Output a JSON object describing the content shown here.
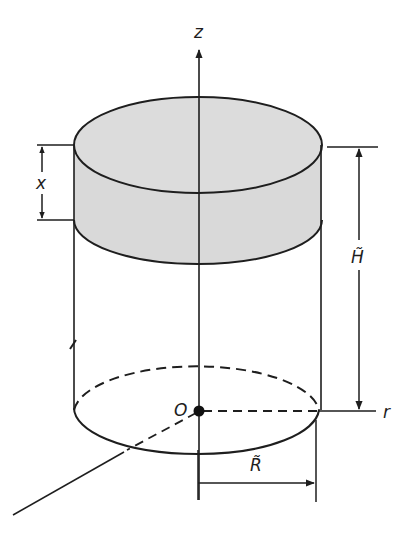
{
  "figure": {
    "colors": {
      "line": "#1e1e1e",
      "fill_shaded": "#d9d9d9",
      "background": "#ffffff"
    }
  },
  "labels": {
    "z_axis": "z",
    "r_axis": "r",
    "origin": "O",
    "layer_thickness": "x",
    "height": "H̃",
    "radius": "R̃"
  },
  "dimensions": [
    {
      "name": "layer_thickness",
      "label": "x",
      "orientation": "vertical",
      "side": "left"
    },
    {
      "name": "height",
      "label": "H̃",
      "orientation": "vertical",
      "side": "right"
    },
    {
      "name": "radius",
      "label": "R̃",
      "orientation": "horizontal",
      "side": "bottom"
    }
  ]
}
